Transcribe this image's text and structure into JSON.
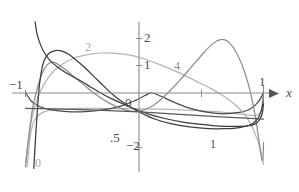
{
  "figure": {
    "name": "chebyshev-weight-plot",
    "caption_fragment": ""
  },
  "axes": {
    "x_axis_label": "x",
    "y_ticks": [
      {
        "label": "2",
        "value": 2
      },
      {
        "label": "1",
        "value": 1
      },
      {
        "label": "0",
        "value": 0
      },
      {
        "label": "−2",
        "value": -2
      }
    ],
    "x_ticks": [
      {
        "label": "−1",
        "value": -1
      },
      {
        "label": ".5",
        "value": 0.5
      },
      {
        "label": "1",
        "value": 1
      }
    ]
  },
  "curve_labels": [
    {
      "name": "curve-label-0",
      "label": "0",
      "color": "#a8a8a8"
    },
    {
      "name": "curve-label-1",
      "label": "1",
      "color": "#4a4a4a"
    },
    {
      "name": "curve-label-2",
      "label": "2",
      "color": "#a8a8a8"
    },
    {
      "name": "curve-label-4",
      "label": "4",
      "color": "#8d8d8d"
    }
  ],
  "colors": {
    "axis": "#8a8a8a",
    "dark_curve": "#3c3c3c",
    "mid_curve": "#6f6f6f",
    "light_curve": "#b4b4b4",
    "background": "#ffffff"
  },
  "chart_data": {
    "type": "line",
    "title": "",
    "xlabel": "x",
    "ylabel": "",
    "xlim": [
      -1.08,
      1.06
    ],
    "ylim": [
      -2.75,
      2.6
    ],
    "grid": false,
    "legend": "inline curve labels",
    "x_tick_labels": [
      "−1",
      ".5",
      "1"
    ],
    "y_tick_labels": [
      "2",
      "1",
      "0",
      "−2"
    ],
    "series": [
      {
        "name": "0",
        "label": "0",
        "color": "#b4b4b4",
        "note": "steep singular branch rising from lower-left, flattening toward y=-0.6 plateau then dipping near x=1",
        "points": [
          [
            -0.985,
            -2.7
          ],
          [
            -0.975,
            -2.2
          ],
          [
            -0.965,
            -1.75
          ],
          [
            -0.95,
            -1.35
          ],
          [
            -0.93,
            -1.05
          ],
          [
            -0.9,
            -0.85
          ],
          [
            -0.85,
            -0.7
          ],
          [
            -0.78,
            -0.62
          ],
          [
            -0.68,
            -0.58
          ],
          [
            -0.55,
            -0.56
          ],
          [
            -0.4,
            -0.56
          ],
          [
            -0.2,
            -0.57
          ],
          [
            0.0,
            -0.58
          ],
          [
            0.2,
            -0.6
          ],
          [
            0.4,
            -0.63
          ],
          [
            0.6,
            -0.68
          ],
          [
            0.75,
            -0.74
          ],
          [
            0.86,
            -0.8
          ],
          [
            0.93,
            -0.82
          ],
          [
            0.97,
            -0.74
          ],
          [
            0.99,
            -0.45
          ],
          [
            1.0,
            0.0
          ]
        ]
      },
      {
        "name": "1",
        "label": "1",
        "color": "#4a4a4a",
        "note": "shallow saddle curve crossing near origin, minimum around x=0.62",
        "points": [
          [
            -1.0,
            0.02
          ],
          [
            -0.95,
            -0.3
          ],
          [
            -0.88,
            -0.5
          ],
          [
            -0.78,
            -0.62
          ],
          [
            -0.65,
            -0.68
          ],
          [
            -0.5,
            -0.68
          ],
          [
            -0.35,
            -0.62
          ],
          [
            -0.2,
            -0.48
          ],
          [
            -0.08,
            -0.28
          ],
          [
            0.0,
            -0.1
          ],
          [
            0.06,
            0.0
          ],
          [
            0.14,
            -0.12
          ],
          [
            0.26,
            -0.36
          ],
          [
            0.4,
            -0.58
          ],
          [
            0.55,
            -0.72
          ],
          [
            0.66,
            -0.76
          ],
          [
            0.78,
            -0.72
          ],
          [
            0.88,
            -0.6
          ],
          [
            0.95,
            -0.36
          ],
          [
            0.99,
            -0.08
          ],
          [
            1.0,
            0.05
          ]
        ]
      },
      {
        "name": "2",
        "label": "2",
        "color": "#b4b4b4",
        "note": "broad single hump peaking near y=1.45 around x=-0.28, descending through origin to minimum near x=0.75",
        "points": [
          [
            -1.0,
            -2.55
          ],
          [
            -0.97,
            -1.55
          ],
          [
            -0.94,
            -0.8
          ],
          [
            -0.9,
            -0.2
          ],
          [
            -0.85,
            0.28
          ],
          [
            -0.78,
            0.72
          ],
          [
            -0.7,
            1.02
          ],
          [
            -0.6,
            1.26
          ],
          [
            -0.48,
            1.4
          ],
          [
            -0.36,
            1.46
          ],
          [
            -0.24,
            1.45
          ],
          [
            -0.12,
            1.38
          ],
          [
            0.0,
            1.24
          ],
          [
            0.14,
            1.02
          ],
          [
            0.28,
            0.76
          ],
          [
            0.42,
            0.46
          ],
          [
            0.56,
            0.16
          ],
          [
            0.66,
            -0.1
          ],
          [
            0.76,
            -0.42
          ],
          [
            0.84,
            -0.78
          ],
          [
            0.9,
            -1.2
          ],
          [
            0.95,
            -1.72
          ],
          [
            0.98,
            -2.2
          ],
          [
            1.0,
            -2.6
          ]
        ]
      },
      {
        "name": "4",
        "label": "4",
        "color": "#8d8d8d",
        "note": "oscillatory curve: early local max near x=-0.80, dips through origin, large max y=1.95 near x=0.62, sharp drop toward x=1",
        "points": [
          [
            -1.0,
            -2.7
          ],
          [
            -0.97,
            -1.5
          ],
          [
            -0.94,
            -0.55
          ],
          [
            -0.9,
            0.18
          ],
          [
            -0.86,
            0.72
          ],
          [
            -0.82,
            1.02
          ],
          [
            -0.78,
            1.12
          ],
          [
            -0.74,
            1.08
          ],
          [
            -0.68,
            0.9
          ],
          [
            -0.6,
            0.62
          ],
          [
            -0.5,
            0.26
          ],
          [
            -0.4,
            -0.08
          ],
          [
            -0.3,
            -0.36
          ],
          [
            -0.2,
            -0.56
          ],
          [
            -0.12,
            -0.66
          ],
          [
            -0.04,
            -0.66
          ],
          [
            0.04,
            -0.54
          ],
          [
            0.12,
            -0.3
          ],
          [
            0.2,
            0.02
          ],
          [
            0.3,
            0.48
          ],
          [
            0.4,
            0.98
          ],
          [
            0.5,
            1.48
          ],
          [
            0.58,
            1.82
          ],
          [
            0.64,
            1.95
          ],
          [
            0.7,
            1.88
          ],
          [
            0.76,
            1.56
          ],
          [
            0.82,
            1.02
          ],
          [
            0.87,
            0.36
          ],
          [
            0.91,
            -0.36
          ],
          [
            0.94,
            -1.1
          ],
          [
            0.965,
            -1.82
          ],
          [
            0.98,
            -2.3
          ],
          [
            0.99,
            -2.48
          ],
          [
            0.997,
            -2.32
          ],
          [
            1.0,
            -1.8
          ]
        ]
      },
      {
        "name": "dark-steep",
        "label": "",
        "color": "#3c3c3c",
        "note": "steep dark monotone decreasing curve entering top-left, crossing x-axis near x=-0.42, flattening to about y=-1.0 near x=1",
        "points": [
          [
            -0.92,
            2.6
          ],
          [
            -0.9,
            2.1
          ],
          [
            -0.87,
            1.72
          ],
          [
            -0.84,
            1.46
          ],
          [
            -0.8,
            1.22
          ],
          [
            -0.74,
            0.98
          ],
          [
            -0.66,
            0.74
          ],
          [
            -0.56,
            0.5
          ],
          [
            -0.46,
            0.24
          ],
          [
            -0.4,
            0.08
          ],
          [
            -0.3,
            -0.16
          ],
          [
            -0.18,
            -0.4
          ],
          [
            -0.06,
            -0.62
          ],
          [
            0.04,
            -0.78
          ],
          [
            0.18,
            -0.94
          ],
          [
            0.32,
            -1.06
          ],
          [
            0.46,
            -1.14
          ],
          [
            0.6,
            -1.2
          ],
          [
            0.74,
            -1.22
          ],
          [
            0.86,
            -1.2
          ],
          [
            0.94,
            -1.1
          ],
          [
            0.985,
            -0.82
          ],
          [
            1.0,
            -0.4
          ]
        ]
      },
      {
        "name": "dark-hump",
        "label": "",
        "color": "#3c3c3c",
        "note": "dark narrow hump peaking near y=1.55 at x=-0.68, steeply descending to cross axis near x=-0.42 and settling near -1.25",
        "points": [
          [
            -0.93,
            -2.75
          ],
          [
            -0.915,
            -1.6
          ],
          [
            -0.9,
            -0.6
          ],
          [
            -0.885,
            0.2
          ],
          [
            -0.865,
            0.82
          ],
          [
            -0.84,
            1.22
          ],
          [
            -0.8,
            1.46
          ],
          [
            -0.75,
            1.55
          ],
          [
            -0.7,
            1.54
          ],
          [
            -0.64,
            1.42
          ],
          [
            -0.58,
            1.22
          ],
          [
            -0.5,
            0.92
          ],
          [
            -0.42,
            0.58
          ],
          [
            -0.34,
            0.24
          ],
          [
            -0.26,
            -0.08
          ],
          [
            -0.16,
            -0.4
          ],
          [
            -0.04,
            -0.7
          ],
          [
            0.08,
            -0.94
          ],
          [
            0.22,
            -1.12
          ],
          [
            0.38,
            -1.24
          ],
          [
            0.54,
            -1.3
          ],
          [
            0.68,
            -1.3
          ],
          [
            0.8,
            -1.26
          ],
          [
            0.9,
            -1.14
          ],
          [
            0.96,
            -0.88
          ],
          [
            0.99,
            -0.5
          ],
          [
            1.0,
            -0.12
          ]
        ]
      },
      {
        "name": "shallow-line",
        "label": "",
        "color": "#5a5a5a",
        "note": "nearly straight gently sloping line from about (-1,-0.58) through origin region to (1,-0.95)",
        "points": [
          [
            -1.0,
            -0.56
          ],
          [
            -0.6,
            -0.6
          ],
          [
            -0.2,
            -0.66
          ],
          [
            0.0,
            -0.7
          ],
          [
            0.3,
            -0.78
          ],
          [
            0.6,
            -0.86
          ],
          [
            0.85,
            -0.92
          ],
          [
            1.0,
            -0.95
          ]
        ]
      }
    ]
  }
}
